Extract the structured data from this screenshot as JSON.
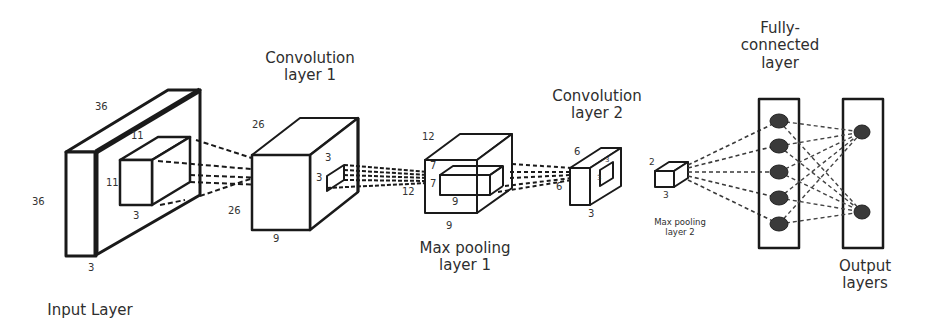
{
  "diagram": {
    "type": "cnn-architecture",
    "stroke_color": "#1a1a1a",
    "node_color": "#3a3a3a",
    "background": "#ffffff"
  },
  "layers": [
    {
      "id": "input",
      "label_line1": "Input Layer",
      "label_line2": "",
      "dims": {
        "height": "36",
        "width": "36",
        "depth": "3"
      },
      "kernel": {
        "height": "11",
        "width": "11",
        "depth": "3"
      }
    },
    {
      "id": "conv1",
      "label_line1": "Convolution",
      "label_line2": "layer 1",
      "dims": {
        "height": "26",
        "width": "26",
        "depth": "9"
      },
      "kernel": {
        "height": "3",
        "width": "3"
      }
    },
    {
      "id": "pool1",
      "label_line1": "Max pooling",
      "label_line2": "layer 1",
      "dims": {
        "height": "12",
        "width": "12",
        "depth": "9"
      },
      "kernel": {
        "height": "7",
        "width": "7",
        "depth": "9"
      }
    },
    {
      "id": "conv2",
      "label_line1": "Convolution",
      "label_line2": "layer 2",
      "dims": {
        "height": "6",
        "width": "6",
        "depth": "3"
      },
      "kernel": {
        "height": "3",
        "width": "3"
      }
    },
    {
      "id": "pool2",
      "label_line1": "Max pooling",
      "label_line2": "layer 2",
      "dims": {
        "height": "2",
        "depth": "3"
      }
    },
    {
      "id": "fc",
      "label_line1": "Fully-",
      "label_line2": "connected",
      "label_line3": "layer",
      "nodes": 5
    },
    {
      "id": "output",
      "label_line1": "Output",
      "label_line2": "layers",
      "nodes": 2
    }
  ]
}
